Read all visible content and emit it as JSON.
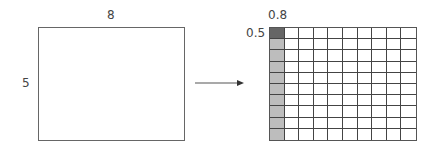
{
  "diagram": {
    "left_rect": {
      "width_label": "8",
      "height_label": "5"
    },
    "right_grid": {
      "cell_width_label": "0.8",
      "cell_height_label": "0.5",
      "rows": 10,
      "cols": 10,
      "highlight_cell_color": "#666666",
      "highlight_column_color": "#bdbdbd"
    },
    "arrow": {
      "direction": "right"
    }
  }
}
